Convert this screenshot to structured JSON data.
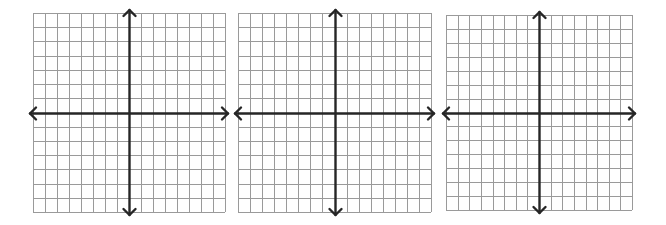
{
  "worksheet": {
    "description": "Three blank coordinate planes with x and y axes",
    "colors": {
      "background": "#ffffff",
      "grid_line": "#9a9a9a",
      "axis_line": "#262626"
    },
    "planes": [
      {
        "id": "plane-1",
        "left": 33,
        "top": 13,
        "width": 192,
        "height": 199,
        "columns": 16,
        "rows": 14,
        "y_axis_column": 8,
        "x_axis_row": 7
      },
      {
        "id": "plane-2",
        "left": 238,
        "top": 13,
        "width": 193,
        "height": 199,
        "columns": 16,
        "rows": 14,
        "y_axis_column": 8,
        "x_axis_row": 7
      },
      {
        "id": "plane-3",
        "left": 446,
        "top": 15,
        "width": 186,
        "height": 195,
        "columns": 16,
        "rows": 14,
        "y_axis_column": 8,
        "x_axis_row": 7
      }
    ]
  }
}
